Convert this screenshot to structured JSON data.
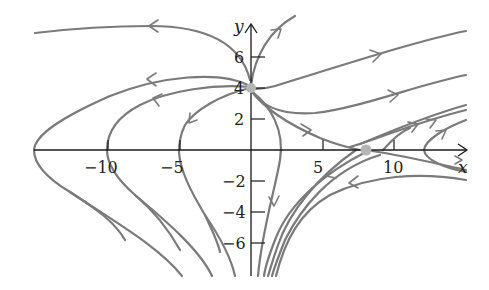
{
  "figure": {
    "type": "phase-portrait",
    "axes": {
      "x_label": "x",
      "y_label": "y",
      "x_ticks": [
        {
          "value": -10,
          "label": "−10"
        },
        {
          "value": -5,
          "label": "−5"
        },
        {
          "value": 5,
          "label": "5"
        },
        {
          "value": 10,
          "label": "10"
        }
      ],
      "y_ticks": [
        {
          "value": 6,
          "label": "6"
        },
        {
          "value": 4,
          "label": "4"
        },
        {
          "value": 2,
          "label": "2"
        },
        {
          "value": -2,
          "label": "−2"
        },
        {
          "value": -4,
          "label": "−4"
        },
        {
          "value": -6,
          "label": "−6"
        }
      ]
    },
    "critical_points": [
      {
        "x": 0,
        "y": 4,
        "kind": "node"
      },
      {
        "x": 8,
        "y": 0,
        "kind": "saddle"
      }
    ],
    "colors": {
      "trajectory": "#7a7a7a",
      "axis": "#1a1a1a",
      "critical_point": "#b5b5b5"
    }
  }
}
